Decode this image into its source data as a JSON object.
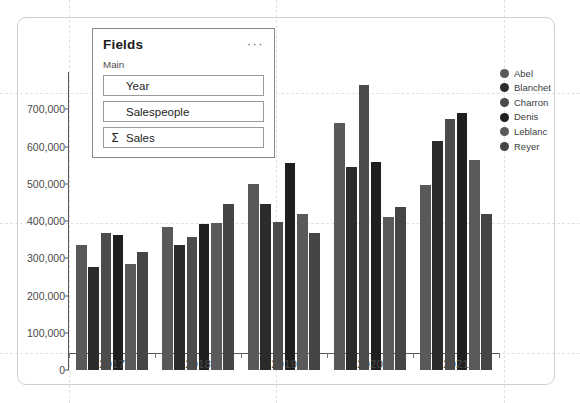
{
  "fields_pane": {
    "title": "Fields",
    "menu_icon": "ellipsis-icon",
    "menu_label": "···",
    "group_label": "Main",
    "items": [
      {
        "label": "Year",
        "aggregate": false,
        "sigma": ""
      },
      {
        "label": "Salespeople",
        "aggregate": false,
        "sigma": ""
      },
      {
        "label": "Sales",
        "aggregate": true,
        "sigma": "Σ"
      }
    ]
  },
  "legend": {
    "position": "right",
    "entries": [
      {
        "label": "Abel",
        "color": "#595959"
      },
      {
        "label": "Blanchet",
        "color": "#2b2b2b"
      },
      {
        "label": "Charron",
        "color": "#4c4c4c"
      },
      {
        "label": "Denis",
        "color": "#1f1f1f"
      },
      {
        "label": "Leblanc",
        "color": "#5a5a5a"
      },
      {
        "label": "Reyer",
        "color": "#454545"
      }
    ]
  },
  "chart_data": {
    "type": "bar",
    "title": "",
    "xlabel": "",
    "ylabel": "",
    "grid": true,
    "legend_position": "right",
    "categories": [
      "2017",
      "2018",
      "2019",
      "2020",
      "2021"
    ],
    "ylim": [
      0,
      800000
    ],
    "yticks": [
      0,
      100000,
      200000,
      300000,
      400000,
      500000,
      600000,
      700000
    ],
    "ytick_labels": [
      "0",
      "100,000",
      "200,000",
      "300,000",
      "400,000",
      "500,000",
      "600,000",
      "700,000"
    ],
    "series": [
      {
        "name": "Abel",
        "color": "#595959",
        "values": [
          335000,
          385000,
          500000,
          663000,
          497000
        ]
      },
      {
        "name": "Blanchet",
        "color": "#2b2b2b",
        "values": [
          277000,
          335000,
          446000,
          544000,
          614000
        ]
      },
      {
        "name": "Charron",
        "color": "#4c4c4c",
        "values": [
          369000,
          356000,
          397000,
          766000,
          673000
        ]
      },
      {
        "name": "Denis",
        "color": "#1f1f1f",
        "values": [
          362000,
          392000,
          555000,
          559000,
          691000
        ]
      },
      {
        "name": "Leblanc",
        "color": "#5a5a5a",
        "values": [
          284000,
          394000,
          419000,
          410000,
          563000
        ]
      },
      {
        "name": "Reyer",
        "color": "#454545",
        "values": [
          317000,
          445000,
          369000,
          438000,
          418000
        ]
      }
    ]
  }
}
